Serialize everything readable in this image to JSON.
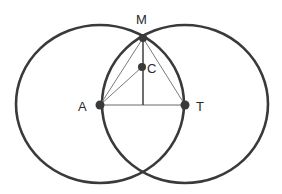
{
  "diagram": {
    "type": "geometric-construction",
    "stroke_color": "#3a3a3a",
    "thin_stroke_color": "#6a6a6a",
    "background": "#ffffff",
    "points": [
      {
        "id": "M",
        "label": "M",
        "x": 143,
        "y": 38
      },
      {
        "id": "C",
        "label": "C",
        "x": 142,
        "y": 67
      },
      {
        "id": "A",
        "label": "A",
        "x": 100,
        "y": 105
      },
      {
        "id": "T",
        "label": "T",
        "x": 185,
        "y": 105
      }
    ],
    "circles": [
      {
        "id": "circle-A",
        "center": "A",
        "passes_through": "T"
      },
      {
        "id": "circle-T",
        "center": "T",
        "passes_through": "A"
      }
    ],
    "segments": [
      [
        "A",
        "T"
      ],
      [
        "A",
        "M"
      ],
      [
        "M",
        "T"
      ],
      [
        "A",
        "C"
      ],
      [
        "M",
        "foot"
      ]
    ],
    "labels": {
      "M": "M",
      "C": "C",
      "A": "A",
      "T": "T"
    }
  }
}
